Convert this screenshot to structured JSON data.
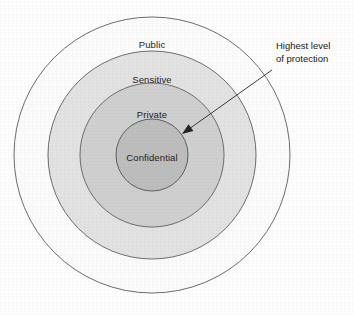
{
  "figure": {
    "background_color": "#fdfdfd",
    "center": {
      "x": 152,
      "y": 155
    }
  },
  "rings": [
    {
      "label": "Public",
      "radius": 138,
      "fill": "#fbfbfb",
      "stroke": "#6d6d6d",
      "label_x": 152,
      "label_y": 44
    },
    {
      "label": "Sensitive",
      "radius": 104,
      "fill": "#e2e2e2",
      "stroke": "#6d6d6d",
      "label_x": 152,
      "label_y": 79
    },
    {
      "label": "Private",
      "radius": 72,
      "fill": "#cfcfcf",
      "stroke": "#6d6d6d",
      "label_x": 152,
      "label_y": 114
    },
    {
      "label": "Confidential",
      "radius": 36,
      "fill": "#bdbdbd",
      "stroke": "#5f5f5f",
      "label_x": 152,
      "label_y": 157
    }
  ],
  "annotation": {
    "line1": "Highest level",
    "line2": "of protection",
    "color": "#1a1a1a",
    "arrow": {
      "start_x": 272,
      "start_y": 70,
      "end_x": 182,
      "end_y": 134,
      "stroke": "#3a3a3a"
    }
  }
}
